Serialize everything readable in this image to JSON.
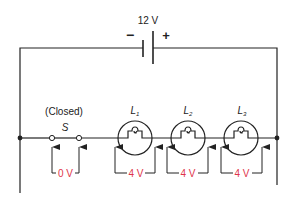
{
  "diagram": {
    "type": "series-circuit",
    "colors": {
      "wire": "#222222",
      "voltage_label": "#e0344a"
    },
    "battery": {
      "label": "12 V",
      "negative_symbol": "−",
      "positive_symbol": "+"
    },
    "switch": {
      "state_label": "(Closed)",
      "name": "S",
      "voltage_drop": "0 V"
    },
    "lamps": [
      {
        "name": "L",
        "subscript": "1",
        "voltage_drop": "4 V"
      },
      {
        "name": "L",
        "subscript": "2",
        "voltage_drop": "4 V"
      },
      {
        "name": "L",
        "subscript": "3",
        "voltage_drop": "4 V"
      }
    ]
  }
}
